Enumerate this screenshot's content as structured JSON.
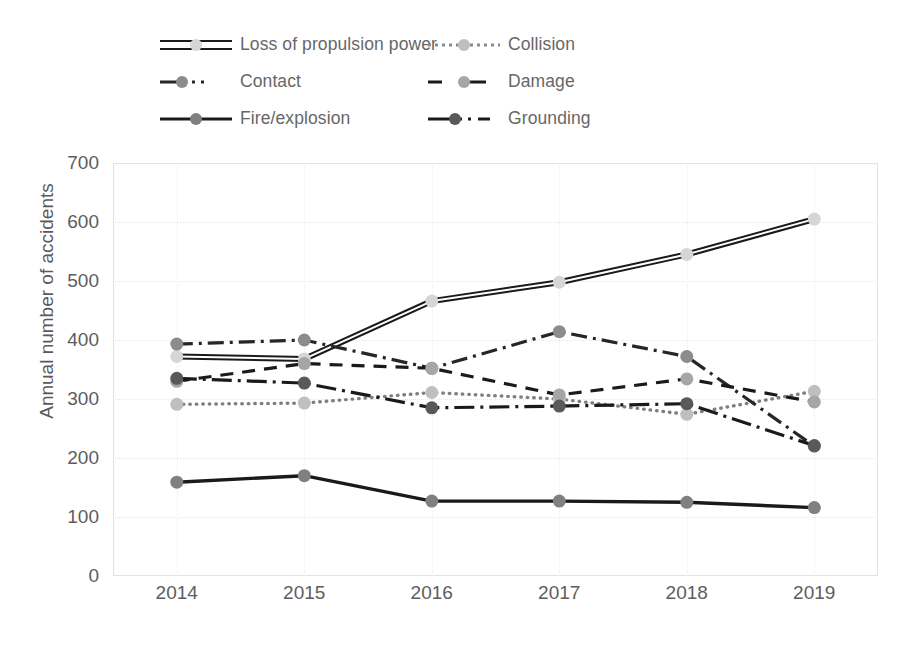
{
  "chart_data": {
    "type": "line",
    "title": "",
    "xlabel": "",
    "ylabel": "Annual number of accidents",
    "categories": [
      "2014",
      "2015",
      "2016",
      "2017",
      "2018",
      "2019"
    ],
    "x": [
      2014,
      2015,
      2016,
      2017,
      2018,
      2019
    ],
    "ylim": [
      0,
      700
    ],
    "yticks": [
      0,
      100,
      200,
      300,
      400,
      500,
      600,
      700
    ],
    "grid": true,
    "legend_position": "top",
    "series": [
      {
        "name": "Loss of propulsion power",
        "style": "double-solid",
        "color": "#1a1a1a",
        "marker_color": "#d6d6d6",
        "values": [
          372,
          368,
          466,
          498,
          545,
          605
        ]
      },
      {
        "name": "Collision",
        "style": "dotted",
        "color": "#7f7f7f",
        "marker_color": "#bfbfbf",
        "values": [
          291,
          293,
          311,
          300,
          274,
          313
        ]
      },
      {
        "name": "Contact",
        "style": "dash-dot",
        "color": "#262626",
        "marker_color": "#8c8c8c",
        "values": [
          393,
          400,
          352,
          414,
          372,
          220
        ]
      },
      {
        "name": "Damage",
        "style": "dashed",
        "color": "#1a1a1a",
        "marker_color": "#a6a6a6",
        "values": [
          330,
          360,
          352,
          307,
          334,
          295
        ]
      },
      {
        "name": "Fire/explosion",
        "style": "solid",
        "color": "#1a1a1a",
        "marker_color": "#808080",
        "values": [
          159,
          170,
          127,
          127,
          125,
          116
        ]
      },
      {
        "name": "Grounding",
        "style": "long-dash-dot",
        "color": "#1a1a1a",
        "marker_color": "#595959",
        "values": [
          335,
          327,
          285,
          288,
          292,
          221
        ]
      }
    ]
  },
  "legend": {
    "rows": [
      [
        {
          "label": "Loss of propulsion power",
          "sample": "double-solid",
          "icon": "legend-swatch-loss-of-propulsion-power"
        },
        {
          "label": "Collision",
          "sample": "dotted",
          "icon": "legend-swatch-collision"
        }
      ],
      [
        {
          "label": "Contact",
          "sample": "dash-dot",
          "icon": "legend-swatch-contact"
        },
        {
          "label": "Damage",
          "sample": "dashed",
          "icon": "legend-swatch-damage"
        }
      ],
      [
        {
          "label": "Fire/explosion",
          "sample": "solid",
          "icon": "legend-swatch-fire-explosion"
        },
        {
          "label": "Grounding",
          "sample": "long-dash-dot",
          "icon": "legend-swatch-grounding"
        }
      ]
    ]
  },
  "axis": {
    "y_title": "Annual number of accidents",
    "y_tick_labels": [
      "700",
      "600",
      "500",
      "400",
      "300",
      "200",
      "100",
      "0"
    ],
    "x_tick_labels": [
      "2014",
      "2015",
      "2016",
      "2017",
      "2018",
      "2019"
    ]
  }
}
